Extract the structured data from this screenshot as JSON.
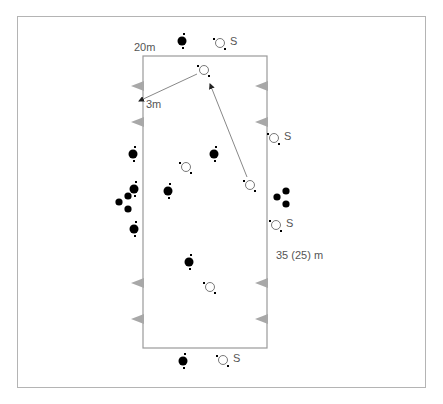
{
  "diagram": {
    "type": "training drill field layout",
    "field": {
      "width_label": "20m",
      "length_label": "35 (25) m",
      "distance_label": "3m"
    },
    "colors": {
      "frame": "#b4b4b4",
      "field_line": "#9a9a9a",
      "cone": "#a8a8a8",
      "team_dark": "#000000",
      "team_light": "#ffffff",
      "arrow": "#888888",
      "text": "#555555"
    },
    "legend_marks": {
      "server_label": "S"
    },
    "players_dark": [
      {
        "x": 182,
        "y": 41
      },
      {
        "x": 133,
        "y": 154
      },
      {
        "x": 214,
        "y": 154
      },
      {
        "x": 134,
        "y": 189
      },
      {
        "x": 168,
        "y": 191
      },
      {
        "x": 134,
        "y": 229
      },
      {
        "x": 189,
        "y": 262
      },
      {
        "x": 183,
        "y": 361
      }
    ],
    "balls_dark": [
      {
        "x": 128,
        "y": 196
      },
      {
        "x": 119,
        "y": 202
      },
      {
        "x": 128,
        "y": 209
      },
      {
        "x": 277,
        "y": 197
      },
      {
        "x": 286,
        "y": 191
      },
      {
        "x": 286,
        "y": 204
      }
    ],
    "players_light": [
      {
        "x": 220,
        "y": 43,
        "label": "S"
      },
      {
        "x": 204,
        "y": 70,
        "label": ""
      },
      {
        "x": 274,
        "y": 138,
        "label": "S"
      },
      {
        "x": 186,
        "y": 167,
        "label": ""
      },
      {
        "x": 250,
        "y": 185,
        "label": ""
      },
      {
        "x": 276,
        "y": 225,
        "label": "S"
      },
      {
        "x": 210,
        "y": 287,
        "label": ""
      },
      {
        "x": 223,
        "y": 360,
        "label": "S"
      }
    ],
    "cones_left_y": [
      86,
      122,
      283,
      319
    ],
    "cones_right_y": [
      86,
      122,
      283,
      319
    ]
  }
}
